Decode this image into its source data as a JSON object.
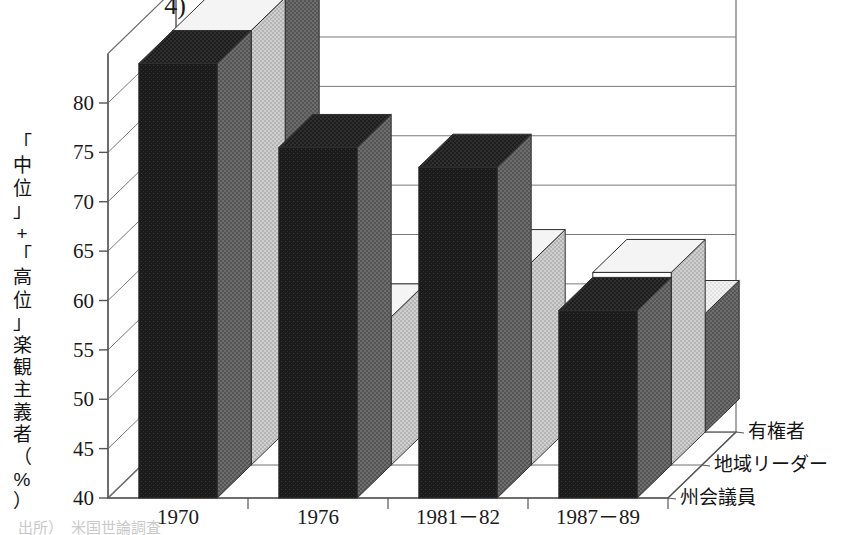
{
  "figure": {
    "clipped_title_top": "4)",
    "clipped_footnote": "出所）　米国世論調査",
    "y_axis_label_chars": [
      "「",
      "中",
      "位",
      "」",
      "+",
      "「",
      "高",
      "位",
      "」",
      "楽",
      "観",
      "主",
      "義",
      "者",
      "（",
      "%",
      "）"
    ],
    "y_axis_label_text": "「中位」+「高位」楽観主義者（%）"
  },
  "chart_data": {
    "type": "bar",
    "title": "",
    "xlabel": "",
    "ylabel": "「中位」+「高位」楽観主義者（%）",
    "ylim": [
      40,
      85
    ],
    "yticks": [
      40,
      45,
      50,
      55,
      60,
      65,
      70,
      75,
      80
    ],
    "grid": true,
    "three_d": true,
    "legend_position": "depth-axis-right",
    "categories": [
      "1970",
      "1976",
      "1981－82",
      "1987－89"
    ],
    "series": [
      {
        "name": "州会議員",
        "color": "#c9c9c9",
        "values": [
          84.0,
          75.5,
          73.5,
          59.0
        ]
      },
      {
        "name": "地域リーダー",
        "color": "#ffffff",
        "values": [
          84.0,
          55.0,
          60.5,
          59.5
        ]
      },
      {
        "name": "有権者",
        "color": "#1c1c1c",
        "values": [
          84.0,
          41.5,
          42.5,
          52.0
        ]
      }
    ]
  },
  "colors": {
    "bar_back_face": "#c9c9c9",
    "bar_back_side": "#6e6e6e",
    "bar_back_top": "#a6a6a6",
    "bar_mid_face": "#ffffff",
    "bar_mid_side": "#c2c2c2",
    "bar_mid_top": "#ededed",
    "bar_front_face": "#1c1c1c",
    "bar_front_side": "#6b6b6b",
    "bar_front_top": "#3b3b3b",
    "axis": "#555555",
    "grid": "#7a7a7a",
    "text": "#1a1a1a"
  }
}
